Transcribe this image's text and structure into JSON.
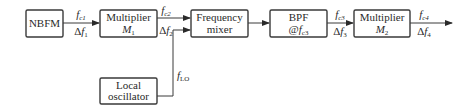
{
  "diagram": {
    "type": "block-diagram",
    "blocks": [
      {
        "id": "nbfm",
        "line1": "NBFM",
        "line2": ""
      },
      {
        "id": "mult1",
        "line1": "Multiplier",
        "line2_main": "M",
        "line2_sub": "1"
      },
      {
        "id": "mixer",
        "line1": "Frequency",
        "line2": "mixer"
      },
      {
        "id": "bpf",
        "line1": "BPF",
        "line2_main": "@f",
        "line2_sub": "c3"
      },
      {
        "id": "mult2",
        "line1": "Multiplier",
        "line2_main": "M",
        "line2_sub": "2"
      },
      {
        "id": "lo",
        "line1": "Local",
        "line2": "oscillator"
      }
    ],
    "signals": [
      {
        "from": "nbfm",
        "to": "mult1",
        "top_main": "f",
        "top_sub": "c1",
        "bottom_prefix": "Δ",
        "bottom_main": "f",
        "bottom_sub": "1"
      },
      {
        "from": "mult1",
        "to": "mixer",
        "top_main": "f",
        "top_sub": "c2",
        "bottom_prefix": "Δ",
        "bottom_main": "f",
        "bottom_sub": "2"
      },
      {
        "from": "bpf",
        "to": "mult2",
        "top_main": "f",
        "top_sub": "c3",
        "bottom_prefix": "Δ",
        "bottom_main": "f",
        "bottom_sub": "3"
      },
      {
        "from": "mult2",
        "to": "output",
        "top_main": "f",
        "top_sub": "c4",
        "bottom_prefix": "Δ",
        "bottom_main": "f",
        "bottom_sub": "4"
      },
      {
        "from": "lo",
        "to": "mixer",
        "label_main": "f",
        "label_sub": "LO"
      }
    ],
    "connections": [
      {
        "from": "nbfm",
        "to": "mult1"
      },
      {
        "from": "mult1",
        "to": "mixer"
      },
      {
        "from": "lo",
        "to": "mixer"
      },
      {
        "from": "mixer",
        "to": "bpf"
      },
      {
        "from": "bpf",
        "to": "mult2"
      },
      {
        "from": "mult2",
        "to": "output"
      }
    ]
  },
  "colors": {
    "stroke": "#3a3a3a",
    "text": "#2a2a2a",
    "background": "#ffffff"
  }
}
